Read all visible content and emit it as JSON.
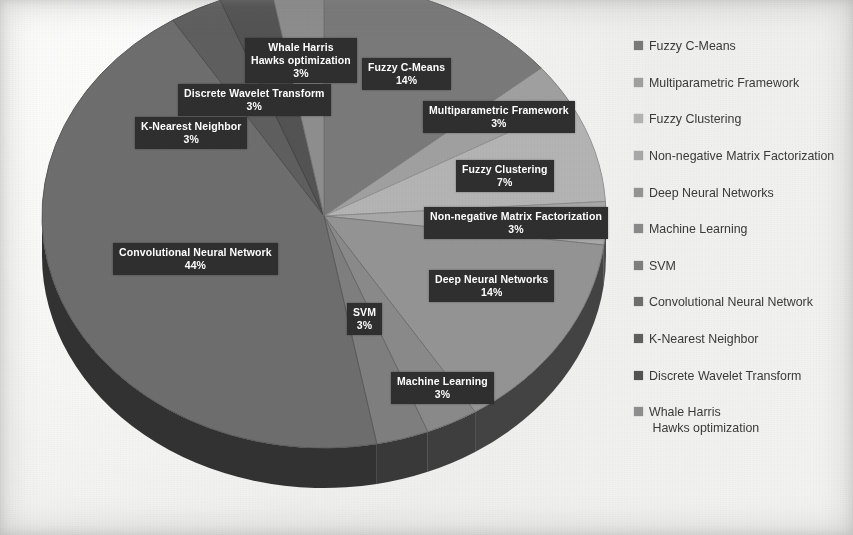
{
  "chart_data": {
    "type": "pie",
    "title": "",
    "subtitle": "",
    "xlabel": "",
    "ylabel": "",
    "legend_position": "right",
    "grid": false,
    "three_d": true,
    "value_unit": "%",
    "categories": [
      "Fuzzy C-Means",
      "Multiparametric Framework",
      "Fuzzy Clustering",
      "Non-negative Matrix Factorization",
      "Deep Neural Networks",
      "Machine Learning",
      "SVM",
      "Convolutional Neural Network",
      "K-Nearest Neighbor",
      "Discrete Wavelet Transform",
      "Whale Harris Hawks optimization"
    ],
    "values": [
      14,
      3,
      7,
      3,
      14,
      3,
      3,
      44,
      3,
      3,
      3
    ],
    "colors": [
      "#7a7a7a",
      "#a0a0a0",
      "#b4b4b4",
      "#a8a8a8",
      "#949494",
      "#8a8a8a",
      "#7f7f7f",
      "#6e6e6e",
      "#5f5f5f",
      "#535353",
      "#8e8e8e"
    ],
    "slices": [
      {
        "label": "Fuzzy C-Means",
        "value": 14,
        "display": "14%",
        "color": "#7a7a7a"
      },
      {
        "label": "Multiparametric Framework",
        "value": 3,
        "display": "3%",
        "color": "#a0a0a0"
      },
      {
        "label": "Fuzzy Clustering",
        "value": 7,
        "display": "7%",
        "color": "#b4b4b4"
      },
      {
        "label": "Non-negative Matrix Factorization",
        "value": 3,
        "display": "3%",
        "color": "#a8a8a8"
      },
      {
        "label": "Deep Neural Networks",
        "value": 14,
        "display": "14%",
        "color": "#949494"
      },
      {
        "label": "Machine Learning",
        "value": 3,
        "display": "3%",
        "color": "#8a8a8a"
      },
      {
        "label": "SVM",
        "value": 3,
        "display": "3%",
        "color": "#7f7f7f"
      },
      {
        "label": "Convolutional Neural Network",
        "value": 44,
        "display": "44%",
        "color": "#6e6e6e"
      },
      {
        "label": "K-Nearest Neighbor",
        "value": 3,
        "display": "3%",
        "color": "#5f5f5f"
      },
      {
        "label": "Discrete Wavelet Transform",
        "value": 3,
        "display": "3%",
        "color": "#535353"
      },
      {
        "label": "Whale Harris Hawks optimization",
        "value": 3,
        "display": "3%",
        "color": "#8e8e8e"
      }
    ]
  },
  "labels": {
    "whale": {
      "line1": "Whale Harris",
      "line2": "Hawks optimization",
      "pct": "3%"
    },
    "dwt": {
      "line1": "Discrete Wavelet Transform",
      "pct": "3%"
    },
    "knn": {
      "line1": "K-Nearest Neighbor",
      "pct": "3%"
    },
    "fcm": {
      "line1": "Fuzzy C-Means",
      "pct": "14%"
    },
    "multi": {
      "line1": "Multiparametric Framework",
      "pct": "3%"
    },
    "fuzzyclust": {
      "line1": "Fuzzy Clustering",
      "pct": "7%"
    },
    "nmf": {
      "line1": "Non-negative Matrix Factorization",
      "pct": "3%"
    },
    "dnn": {
      "line1": "Deep Neural Networks",
      "pct": "14%"
    },
    "cnn": {
      "line1": "Convolutional Neural Network",
      "pct": "44%"
    },
    "svm": {
      "line1": "SVM",
      "pct": "3%"
    },
    "ml": {
      "line1": "Machine Learning",
      "pct": "3%"
    }
  },
  "legend": {
    "items": [
      {
        "label": "Fuzzy C-Means",
        "color": "#7a7a7a"
      },
      {
        "label": "Multiparametric Framework",
        "color": "#a0a0a0"
      },
      {
        "label": "Fuzzy Clustering",
        "color": "#b4b4b4"
      },
      {
        "label": "Non-negative Matrix Factorization",
        "color": "#a8a8a8"
      },
      {
        "label": "Deep Neural Networks",
        "color": "#949494"
      },
      {
        "label": "Machine Learning",
        "color": "#8a8a8a"
      },
      {
        "label": "SVM",
        "color": "#7f7f7f"
      },
      {
        "label": "Convolutional Neural Network",
        "color": "#6e6e6e"
      },
      {
        "label": "K-Nearest Neighbor",
        "color": "#5f5f5f"
      },
      {
        "label": "Discrete Wavelet Transform",
        "color": "#535353"
      },
      {
        "label": "Whale Harris",
        "label2": "Hawks optimization",
        "color": "#8e8e8e"
      }
    ]
  }
}
